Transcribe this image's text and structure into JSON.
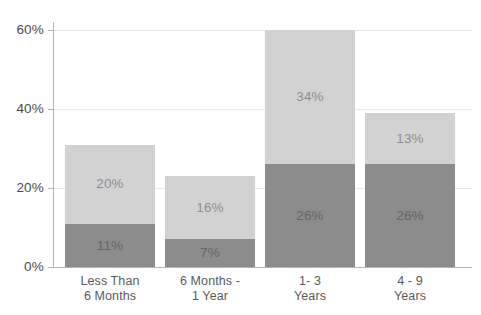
{
  "chart_data": {
    "type": "bar",
    "subtype": "stacked-bar",
    "title": "",
    "xlabel": "",
    "ylabel": "",
    "ylim": [
      0,
      60
    ],
    "grid": true,
    "legend": "none",
    "categories": [
      {
        "line1": "Less Than",
        "line2": "6 Months"
      },
      {
        "line1": "6 Months -",
        "line2": "1 Year"
      },
      {
        "line1": "1- 3",
        "line2": "Years"
      },
      {
        "line1": "4 - 9",
        "line2": "Years"
      }
    ],
    "y_ticks": [
      {
        "value": 60,
        "label": "60%"
      },
      {
        "value": 40,
        "label": "40%"
      },
      {
        "value": 20,
        "label": "20%"
      },
      {
        "value": 0,
        "label": "0%"
      }
    ],
    "series": [
      {
        "name": "lower-segment",
        "color": "#8c8c8c",
        "values": [
          11,
          7,
          26,
          26
        ],
        "labels": [
          "11%",
          "7%",
          "26%",
          "26%"
        ]
      },
      {
        "name": "upper-segment",
        "color": "#d2d2d2",
        "values": [
          20,
          16,
          34,
          13
        ],
        "labels": [
          "20%",
          "16%",
          "34%",
          "13%"
        ]
      }
    ],
    "totals": [
      31,
      23,
      60,
      39
    ],
    "colors": {
      "upper": "#d2d2d2",
      "lower": "#8c8c8c",
      "gridline": "#e9e9e9",
      "axis": "#b4b4b4",
      "tick_text": "#4a4a4a",
      "category_text": "#5a5a5a",
      "label_on_light": "#8e8e8e",
      "label_on_dark": "#666666",
      "background": "#ffffff"
    }
  }
}
